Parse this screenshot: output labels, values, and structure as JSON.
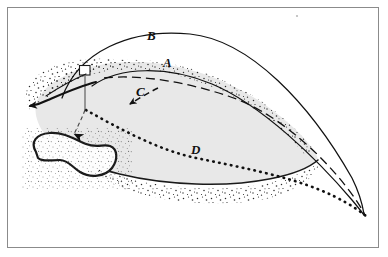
{
  "figure": {
    "title": "",
    "caption": "",
    "domain_type": "diagram",
    "background_color": "#ffffff",
    "frame": {
      "border_color": "#8b8b8b",
      "border_width": 1,
      "inset": 7
    }
  },
  "labels": [
    {
      "id": "A",
      "text": "A",
      "x": 168,
      "y": 62,
      "style": "bold-italic-serif"
    },
    {
      "id": "B",
      "text": "B",
      "x": 152,
      "y": 35,
      "style": "bold-italic-serif"
    },
    {
      "id": "C",
      "text": "C",
      "x": 141,
      "y": 91,
      "style": "bold-italic-serif"
    },
    {
      "id": "D",
      "text": "D",
      "x": 196,
      "y": 149,
      "style": "bold-italic-serif"
    }
  ],
  "colors": {
    "ink": "#111111",
    "body_fill": "#e8e8e8",
    "body_stroke": "#1a1a1a",
    "stipple": "#2a2a2a",
    "marker_fill": "#ffffff",
    "frame": "#8b8b8b"
  },
  "elements": {
    "main_body": {
      "name": "main-lobe-shape",
      "fill": "#e8e8e8",
      "description": "large lens-shaped mass with stippled margin"
    },
    "secondary_body": {
      "name": "secondary-lobe-shape",
      "fill": "#ffffff",
      "description": "small kidney-shaped outline lobe lower left"
    },
    "marker_square": {
      "name": "marker-square",
      "fill": "#ffffff",
      "width": 10,
      "height": 9
    },
    "trajectory_A": {
      "name": "trajectory-A",
      "style": "solid",
      "label": "A"
    },
    "trajectory_B": {
      "name": "trajectory-B",
      "style": "solid",
      "label": "B"
    },
    "trajectory_C": {
      "name": "trajectory-C",
      "style": "dashed",
      "label": "C"
    },
    "trajectory_D": {
      "name": "trajectory-D",
      "style": "dotted",
      "label": "D"
    },
    "arrow_left": {
      "name": "left-flow-arrow",
      "direction": "left",
      "style": "solid"
    },
    "arrow_down": {
      "name": "down-flow-arrow",
      "direction": "down",
      "style": "dashed"
    },
    "arrow_C": {
      "name": "arrow-C",
      "direction": "down-left",
      "style": "dashed"
    }
  }
}
